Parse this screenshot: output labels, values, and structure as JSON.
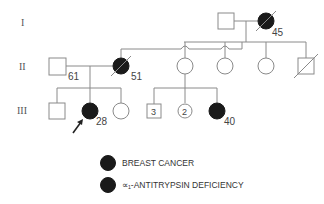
{
  "pedigree": {
    "generations": [
      {
        "label": "I"
      },
      {
        "label": "II"
      },
      {
        "label": "III"
      }
    ],
    "individuals": {
      "I_1": {
        "sex": "male",
        "affected": false,
        "deceased": false
      },
      "I_2": {
        "sex": "female",
        "affected": true,
        "deceased": true,
        "age": "45"
      },
      "II_1": {
        "sex": "male",
        "affected": false,
        "deceased": false,
        "age": "61"
      },
      "II_2": {
        "sex": "female",
        "affected": true,
        "deceased": true,
        "age": "51"
      },
      "II_3": {
        "sex": "female",
        "affected": false,
        "deceased": false
      },
      "II_4": {
        "sex": "female",
        "affected": false,
        "deceased": false
      },
      "II_5": {
        "sex": "female",
        "affected": false,
        "deceased": false
      },
      "II_6": {
        "sex": "male",
        "affected": false,
        "deceased": true
      },
      "III_1": {
        "sex": "male",
        "affected": false,
        "deceased": false
      },
      "III_2": {
        "sex": "female",
        "affected": true,
        "deceased": false,
        "age": "28",
        "proband": true
      },
      "III_3": {
        "sex": "female",
        "affected": false,
        "deceased": false
      },
      "III_4": {
        "sex": "male",
        "affected": false,
        "count": "3"
      },
      "III_5": {
        "sex": "female",
        "affected": false,
        "count": "2"
      },
      "III_6": {
        "sex": "female",
        "affected": true,
        "deceased": false,
        "age": "40"
      }
    }
  },
  "legend": {
    "items": [
      {
        "label": "BREAST CANCER"
      },
      {
        "label": "∝₁-ANTITRYPSIN DEFICIENCY"
      }
    ]
  },
  "colors": {
    "affected": "#1a1a1a",
    "line": "#8a8a8a"
  }
}
